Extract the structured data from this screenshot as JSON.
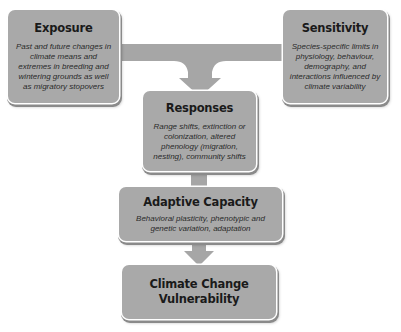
{
  "diagram": {
    "boxes": {
      "exposure": {
        "title": "Exposure",
        "description": "Past and future changes in climate means and extremes in breeding and wintering grounds as well as migratory stopovers"
      },
      "sensitivity": {
        "title": "Sensitivity",
        "description": "Species-specific limits in physiology, behaviour, demography, and interactions influenced by climate variability"
      },
      "responses": {
        "title": "Responses",
        "description": "Range shifts, extinction or colonization, altered phenology (migration, nesting), community shifts"
      },
      "adaptive_capacity": {
        "title": "Adaptive Capacity",
        "description": "Behavioral plasticity, phenotypic and genetic variation, adaptation"
      },
      "vulnerability": {
        "title": "Climate Change Vulnerability"
      }
    },
    "connectors": [
      {
        "from": [
          "Exposure",
          "Sensitivity"
        ],
        "to": "Responses",
        "type": "merge-arrow"
      },
      {
        "from": "Responses",
        "to": "Adaptive Capacity",
        "type": "short-bar"
      },
      {
        "from": "Adaptive Capacity",
        "to": "Climate Change Vulnerability",
        "type": "down-arrow"
      }
    ],
    "colors": {
      "box_fill": "#a9a9a9",
      "connector_fill": "#a6a6a6",
      "text": "#1a1a1a",
      "background": "#ffffff"
    }
  }
}
